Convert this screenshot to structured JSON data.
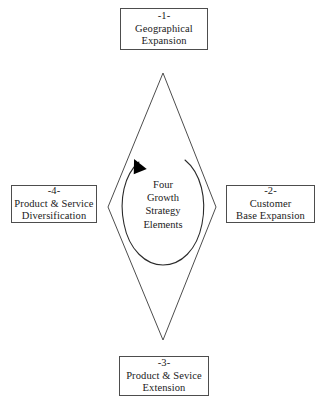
{
  "diagram": {
    "title_center": {
      "lines": [
        "Four",
        "Growth",
        "Strategy",
        "Elements"
      ]
    },
    "nodes": {
      "top": {
        "index": "-1-",
        "line1": "Geographical",
        "line2": "Expansion"
      },
      "right": {
        "index": "-2-",
        "line1": "Customer",
        "line2": "Base Expansion"
      },
      "bottom": {
        "index": "-3-",
        "line1": "Product & Sevice",
        "line2": "Extension"
      },
      "left": {
        "index": "-4-",
        "line1": "Product & Service",
        "line2": "Diversification"
      }
    },
    "colors": {
      "stroke": "#4d4d4d",
      "text": "#1a1a1a",
      "background": "#ffffff",
      "arrow_fill": "#000000"
    }
  }
}
